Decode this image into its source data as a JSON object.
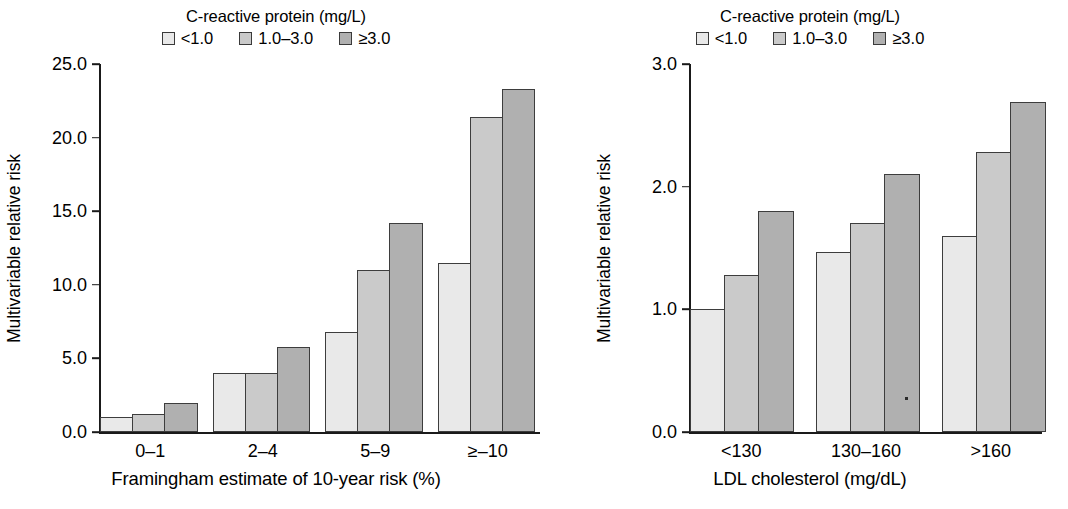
{
  "figure": {
    "background": "#ffffff",
    "panels": [
      "left",
      "right"
    ]
  },
  "legend": {
    "title": "C-reactive protein (mg/L)",
    "items": [
      {
        "label": "<1.0",
        "color": "#e9e9e9"
      },
      {
        "label": "1.0–3.0",
        "color": "#cacaca"
      },
      {
        "label": "≥3.0",
        "color": "#b0b0b0"
      }
    ]
  },
  "left_panel": {
    "ylabel": "Multivariable relative risk",
    "xlabel": "Framingham estimate of 10-year risk (%)",
    "yticks": [
      "0.0",
      "5.0",
      "10.0",
      "15.0",
      "20.0",
      "25.0"
    ],
    "categories": [
      "0–1",
      "2–4",
      "5–9",
      "≥–10"
    ]
  },
  "right_panel": {
    "ylabel": "Multivariable relative risk",
    "xlabel": "LDL cholesterol (mg/dL)",
    "yticks": [
      "0.0",
      "1.0",
      "2.0",
      "3.0"
    ],
    "categories": [
      "<130",
      "130–160",
      ">160"
    ]
  },
  "chart_data": [
    {
      "type": "bar",
      "title": "C-reactive protein (mg/L)",
      "panel": "left",
      "xlabel": "Framingham estimate of 10-year risk (%)",
      "ylabel": "Multivariable relative risk",
      "categories": [
        "0–1",
        "2–4",
        "5–9",
        "≥–10"
      ],
      "ylim": [
        0.0,
        25.0
      ],
      "ytick_values": [
        0.0,
        5.0,
        10.0,
        15.0,
        20.0,
        25.0
      ],
      "grid": false,
      "legend_position": "top-center",
      "series": [
        {
          "name": "<1.0",
          "color": "#e9e9e9",
          "values": [
            1.0,
            4.0,
            6.8,
            11.5
          ]
        },
        {
          "name": "1.0–3.0",
          "color": "#cacaca",
          "values": [
            1.25,
            4.0,
            11.0,
            21.4
          ]
        },
        {
          "name": "≥3.0",
          "color": "#b0b0b0",
          "values": [
            2.0,
            5.8,
            14.2,
            23.3
          ]
        }
      ]
    },
    {
      "type": "bar",
      "title": "C-reactive protein (mg/L)",
      "panel": "right",
      "xlabel": "LDL cholesterol (mg/dL)",
      "ylabel": "Multivariable relative risk",
      "categories": [
        "<130",
        "130–160",
        ">160"
      ],
      "ylim": [
        0.0,
        3.0
      ],
      "ytick_values": [
        0.0,
        1.0,
        2.0,
        3.0
      ],
      "grid": false,
      "legend_position": "top-center",
      "series": [
        {
          "name": "<1.0",
          "color": "#e9e9e9",
          "values": [
            1.0,
            1.47,
            1.6
          ]
        },
        {
          "name": "1.0–3.0",
          "color": "#cacaca",
          "values": [
            1.28,
            1.7,
            2.28
          ]
        },
        {
          "name": "≥3.0",
          "color": "#b0b0b0",
          "values": [
            1.8,
            2.1,
            2.69
          ]
        }
      ]
    }
  ]
}
